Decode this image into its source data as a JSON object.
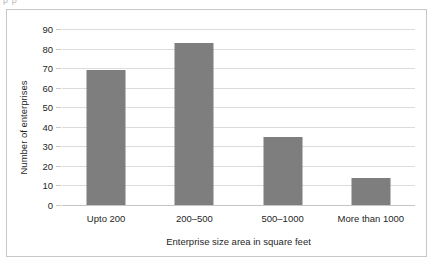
{
  "figure": {
    "top_clipped_text": "p                               p",
    "frame_color": "#c8c8c8",
    "background": "#ffffff"
  },
  "chart_data": {
    "type": "bar",
    "title": "",
    "xlabel": "Enterprise size area in square feet",
    "ylabel": "Number of enterprises",
    "categories": [
      "Upto 200",
      "200–500",
      "500–1000",
      "More than 1000"
    ],
    "values": [
      69,
      83,
      35,
      14
    ],
    "ylim": [
      0,
      90
    ],
    "ytick_step": 10,
    "yticks": [
      0,
      10,
      20,
      30,
      40,
      50,
      60,
      70,
      80,
      90
    ],
    "ytick_labels": [
      "0",
      "10",
      "20",
      "30",
      "40",
      "50",
      "60",
      "70",
      "80",
      "90"
    ],
    "grid": true,
    "grid_axis": "y",
    "grid_color": "#dcdcdc",
    "legend": false,
    "bar_color": "#7e7e7e",
    "orientation": "vertical",
    "series": [
      {
        "name": "Number of enterprises",
        "values": [
          69,
          83,
          35,
          14
        ]
      }
    ]
  }
}
